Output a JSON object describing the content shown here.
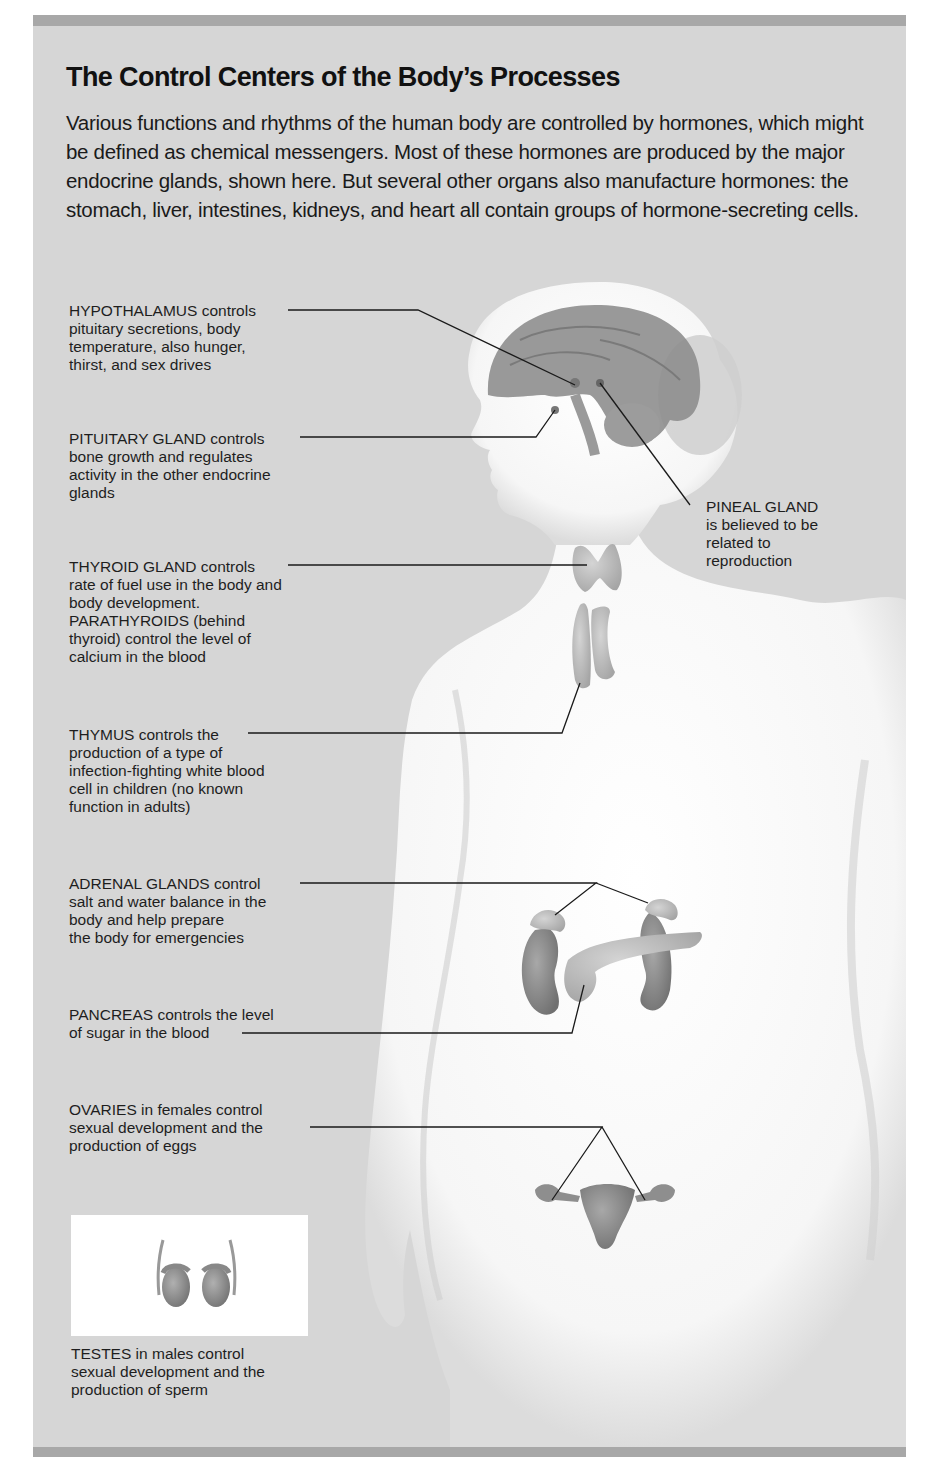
{
  "title": "The Control Centers of the Body’s Processes",
  "intro": "Various functions and rhythms of the human body are controlled by hormones, which might be defined as chemical messengers. Most of these hormones are produced by the major endocrine glands, shown here. But several other organs also manufacture hormones: the stomach, liver, intestines, kidneys, and heart all contain groups of hormone-secreting cells.",
  "colors": {
    "panel": "#d6d6d6",
    "bars": "#a8a8a8",
    "body": "#f8f8f8",
    "organ": "#8a8a8a",
    "leader_line": "#1a1a1a"
  },
  "labels": {
    "hypothalamus": "HYPOTHALAMUS controls\npituitary secretions, body\ntemperature, also hunger,\nthirst, and sex drives",
    "pituitary": "PITUITARY GLAND controls\nbone growth and regulates\nactivity in the other endocrine\nglands",
    "pineal": "PINEAL GLAND\nis believed to be\nrelated to\nreproduction",
    "thyroid": "THYROID GLAND controls\nrate of fuel use in the body and\nbody development.\nPARATHYROIDS (behind\nthyroid) control the level of\ncalcium in the blood",
    "thymus": "THYMUS controls the\nproduction of a type of\ninfection-fighting white blood\ncell in children (no known\nfunction in adults)",
    "adrenal": "ADRENAL GLANDS control\nsalt and water balance in the\nbody and help prepare\nthe body for emergencies",
    "pancreas": "PANCREAS controls the level\nof sugar in the blood",
    "ovaries": "OVARIES in females control\nsexual development and the\nproduction of eggs",
    "testes": "TESTES in males control\nsexual development and the\nproduction of sperm"
  },
  "organs": [
    "hypothalamus",
    "pituitary gland",
    "pineal gland",
    "thyroid gland",
    "parathyroids",
    "thymus",
    "adrenal glands",
    "kidneys",
    "pancreas",
    "ovaries",
    "uterus",
    "testes",
    "brain"
  ]
}
